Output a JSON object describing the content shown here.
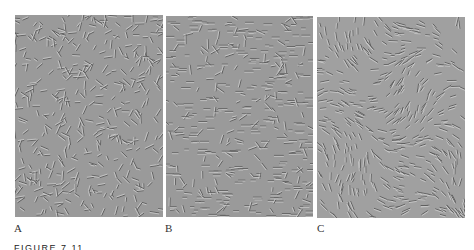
{
  "figure": {
    "caption": "FIGURE 7.11",
    "panels": [
      {
        "label": "A",
        "texture": "gabor-patch-field",
        "background": "#9a9a9a"
      },
      {
        "label": "B",
        "texture": "gabor-patch-field",
        "background": "#9a9a9a"
      },
      {
        "label": "C",
        "texture": "gabor-patch-field",
        "background": "#a0a0a0"
      }
    ]
  }
}
